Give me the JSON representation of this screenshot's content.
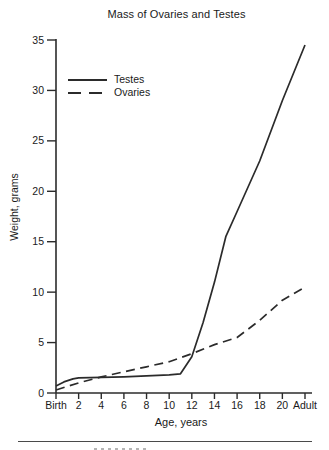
{
  "colors": {
    "line": "#2b2b2b",
    "axis": "#2b2b2b",
    "text": "#1a1a1a",
    "background": "#ffffff"
  },
  "chart_data": {
    "type": "line",
    "title": "Mass of Ovaries and Testes",
    "xlabel": "Age, years",
    "ylabel": "Weight, grams",
    "x_tick_labels": [
      "Birth",
      "2",
      "4",
      "6",
      "8",
      "10",
      "12",
      "14",
      "16",
      "18",
      "20",
      "Adult"
    ],
    "x_tick_values": [
      0,
      2,
      4,
      6,
      8,
      10,
      12,
      14,
      16,
      18,
      20,
      22
    ],
    "xlim": [
      0,
      22
    ],
    "y_ticks": [
      0,
      5,
      10,
      15,
      20,
      25,
      30,
      35
    ],
    "ylim": [
      0,
      35
    ],
    "grid": false,
    "legend_position": "upper-left-inside",
    "series": [
      {
        "name": "Testes",
        "dash": "solid",
        "x": [
          0,
          0.7,
          1.5,
          2,
          4,
          6,
          8,
          10,
          11,
          12,
          13,
          14,
          15,
          16,
          18,
          20,
          22
        ],
        "values": [
          0.7,
          1.1,
          1.4,
          1.5,
          1.55,
          1.6,
          1.7,
          1.8,
          1.9,
          3.6,
          7.0,
          11.0,
          15.5,
          18.0,
          23.0,
          29.0,
          34.5
        ]
      },
      {
        "name": "Ovaries",
        "dash": "dashed",
        "x": [
          0,
          2,
          4,
          6,
          8,
          10,
          12,
          14,
          16,
          18,
          20,
          22
        ],
        "values": [
          0.3,
          1.0,
          1.6,
          2.1,
          2.6,
          3.1,
          3.9,
          4.8,
          5.5,
          7.2,
          9.2,
          10.5
        ]
      }
    ]
  }
}
